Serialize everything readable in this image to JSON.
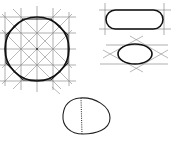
{
  "diagram": {
    "title": "",
    "figures": [
      {
        "id": "circle-grid",
        "description": "Circle sketched inside square grid with diagonals and octagon guide"
      },
      {
        "id": "rounded-rectangle",
        "description": "Rounded rectangle (stadium) between two horizontal and two vertical guide lines"
      },
      {
        "id": "ellipse-rhombus",
        "description": "Ellipse inscribed in rhombus between horizontal guide lines"
      },
      {
        "id": "oval-axis",
        "description": "Freehand oval with dotted vertical axis"
      }
    ],
    "colors": {
      "ink": "#111111",
      "guide": "#7a7a7a",
      "background": "#ffffff"
    }
  }
}
